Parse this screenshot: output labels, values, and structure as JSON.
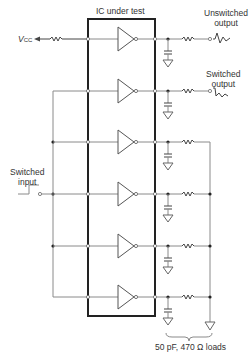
{
  "diagram": {
    "title": "IC under test",
    "labels": {
      "vcc_main": "V",
      "vcc_sub": "CC",
      "unswitched_line1": "Unswitched",
      "unswitched_line2": "output",
      "switched_out_line1": "Switched",
      "switched_out_line2": "output",
      "switched_in_line1": "Switched",
      "switched_in_line2": "input",
      "loads": "50 pF, 470 Ω loads"
    },
    "buffers": [
      {
        "index": 1,
        "input": "Vcc",
        "output": "Unswitched output"
      },
      {
        "index": 2,
        "input": "Switched input",
        "output": "Switched output"
      },
      {
        "index": 3,
        "input": "Switched input",
        "output": "load"
      },
      {
        "index": 4,
        "input": "Switched input",
        "output": "load"
      },
      {
        "index": 5,
        "input": "Switched input",
        "output": "load"
      },
      {
        "index": 6,
        "input": "Switched input",
        "output": "load"
      }
    ],
    "load_values": {
      "capacitance": "50 pF",
      "resistance": "470 Ω"
    },
    "colors": {
      "wire": "#8a8a8a",
      "ic_border": "#222222",
      "text": "#333333"
    }
  }
}
